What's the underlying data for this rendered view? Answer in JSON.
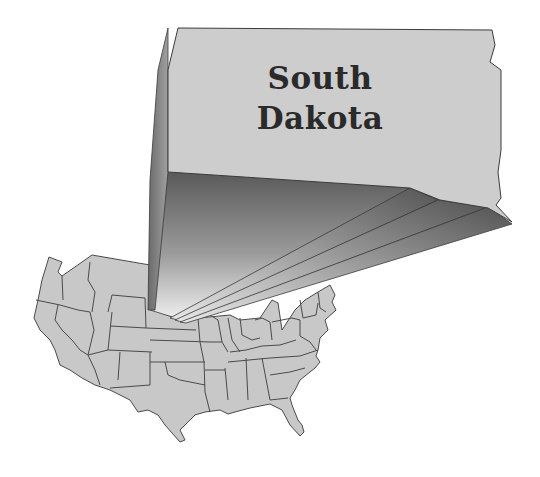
{
  "map": {
    "title_line1": "South",
    "title_line2": "Dakota",
    "highlighted_state": "South Dakota",
    "base_map": "Contiguous United States",
    "colors": {
      "state_fill": "#c8c8c8",
      "state_border": "#4a4a4a",
      "highlight_fill": "#cdcdcd",
      "projection_dark": "#5a5a5a",
      "projection_light": "#f2f2f2",
      "background": "#ffffff",
      "label": "#2a2a2a"
    }
  }
}
